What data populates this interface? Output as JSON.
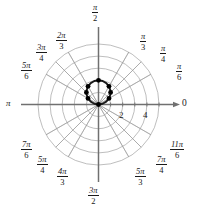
{
  "figure": {
    "name": "polar-grid-plot",
    "background_color": "#ffffff",
    "grid_color": "#9a9a9a",
    "axis_color": "#707070",
    "curve_color": "#1a1a1a",
    "point_color": "#000000"
  },
  "axis_labels": {
    "right": "0",
    "left": "π",
    "top_num": "π",
    "top_den": "2",
    "bottom_num": "3π",
    "bottom_den": "2"
  },
  "angle_labels": [
    {
      "num": "π",
      "den": "6",
      "deg": 30,
      "x": 176,
      "y": 62
    },
    {
      "num": "π",
      "den": "4",
      "deg": 45,
      "x": 160,
      "y": 44
    },
    {
      "num": "π",
      "den": "3",
      "deg": 60,
      "x": 140,
      "y": 32
    },
    {
      "num": "2π",
      "den": "3",
      "deg": 120,
      "x": 56,
      "y": 31
    },
    {
      "num": "3π",
      "den": "4",
      "deg": 135,
      "x": 36,
      "y": 43
    },
    {
      "num": "5π",
      "den": "6",
      "deg": 150,
      "x": 21,
      "y": 61
    },
    {
      "num": "7π",
      "den": "6",
      "deg": 210,
      "x": 21,
      "y": 140
    },
    {
      "num": "5π",
      "den": "4",
      "deg": 225,
      "x": 37,
      "y": 155
    },
    {
      "num": "4π",
      "den": "3",
      "deg": 240,
      "x": 57,
      "y": 167
    },
    {
      "num": "5π",
      "den": "3",
      "deg": 300,
      "x": 135,
      "y": 167
    },
    {
      "num": "7π",
      "den": "4",
      "deg": 315,
      "x": 156,
      "y": 155
    },
    {
      "num": "11π",
      "den": "6",
      "deg": 330,
      "x": 170,
      "y": 140
    }
  ],
  "radial_ticks": [
    {
      "label": "2",
      "value": 2,
      "x": 119,
      "y": 111
    },
    {
      "label": "4",
      "value": 4,
      "x": 143,
      "y": 111
    }
  ],
  "chart_data": {
    "type": "line",
    "plot_kind": "polar",
    "title": "",
    "xlabel": "",
    "ylabel": "",
    "theta_unit": "radians",
    "r_max": 5,
    "grid": true,
    "grid_circles_r": [
      1,
      2,
      3,
      4,
      5
    ],
    "grid_rays_deg": [
      0,
      30,
      45,
      60,
      90,
      120,
      135,
      150,
      180,
      210,
      225,
      240,
      270,
      300,
      315,
      330
    ],
    "legend": "none",
    "equation": "r = 2 sin(θ)",
    "series": [
      {
        "name": "r = 2 sin(theta)",
        "color": "#1a1a1a",
        "theta_deg": [
          0,
          10,
          20,
          30,
          40,
          50,
          60,
          70,
          80,
          90,
          100,
          110,
          120,
          130,
          140,
          150,
          160,
          170,
          180
        ],
        "r": [
          0,
          0.347,
          0.684,
          1.0,
          1.286,
          1.532,
          1.732,
          1.879,
          1.97,
          2.0,
          1.97,
          1.879,
          1.732,
          1.532,
          1.286,
          1.0,
          0.684,
          0.347,
          0
        ]
      }
    ],
    "marked_points": [
      {
        "theta_deg": 30,
        "r": 1.0
      },
      {
        "theta_deg": 45,
        "r": 1.414
      },
      {
        "theta_deg": 60,
        "r": 1.732
      },
      {
        "theta_deg": 90,
        "r": 2.0
      },
      {
        "theta_deg": 120,
        "r": 1.732
      },
      {
        "theta_deg": 135,
        "r": 1.414
      },
      {
        "theta_deg": 150,
        "r": 1.0
      },
      {
        "theta_deg": 180,
        "r": 0.0
      }
    ]
  }
}
